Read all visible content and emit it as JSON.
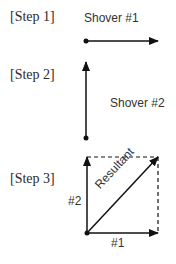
{
  "steps": [
    {
      "label": "[Step 1]",
      "vector_label": "Shover #1"
    },
    {
      "label": "[Step 2]",
      "vector_label": "Shover #2"
    },
    {
      "label": "[Step 3]",
      "labels": {
        "vertical": "#2",
        "horizontal": "#1",
        "diagonal": "Resultant"
      }
    }
  ]
}
